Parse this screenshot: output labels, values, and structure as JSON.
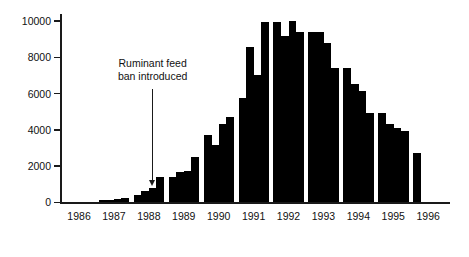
{
  "chart_data": {
    "type": "bar",
    "title": "",
    "subtitle": "",
    "xlabel": "",
    "ylabel": "",
    "ylim": [
      0,
      10400
    ],
    "yticks": [
      0,
      2000,
      4000,
      6000,
      8000,
      10000
    ],
    "ytick_labels": [
      "0",
      "2000",
      "4000",
      "6000",
      "8000",
      "10000"
    ],
    "xticks": [
      1986,
      1987,
      1988,
      1989,
      1990,
      1991,
      1992,
      1993,
      1994,
      1995,
      1996
    ],
    "xtick_labels": [
      "1986",
      "1987",
      "1988",
      "1989",
      "1990",
      "1991",
      "1992",
      "1993",
      "1994",
      "1995",
      "1996"
    ],
    "grid": false,
    "legend": "none",
    "bar_color": "#000000",
    "x_unit": "quarter",
    "categories": [
      "1986 Q1",
      "1986 Q2",
      "1986 Q3",
      "1986 Q4",
      "1987 Q1",
      "1987 Q2",
      "1987 Q3",
      "1987 Q4",
      "1988 Q1",
      "1988 Q2",
      "1988 Q3",
      "1988 Q4",
      "1989 Q1",
      "1989 Q2",
      "1989 Q3",
      "1989 Q4",
      "1990 Q1",
      "1990 Q2",
      "1990 Q3",
      "1990 Q4",
      "1991 Q1",
      "1991 Q2",
      "1991 Q3",
      "1991 Q4",
      "1992 Q1",
      "1992 Q2",
      "1992 Q3",
      "1992 Q4",
      "1993 Q1",
      "1993 Q2",
      "1993 Q3",
      "1993 Q4",
      "1994 Q1",
      "1994 Q2",
      "1994 Q3",
      "1994 Q4",
      "1995 Q1",
      "1995 Q2",
      "1995 Q3",
      "1995 Q4",
      "1996 Q1"
    ],
    "values": [
      0,
      0,
      0,
      0,
      120,
      130,
      190,
      260,
      420,
      620,
      790,
      1400,
      1400,
      1700,
      1720,
      2500,
      3700,
      3150,
      4350,
      4700,
      5750,
      8600,
      7050,
      9950,
      9950,
      9200,
      10000,
      9400,
      9400,
      9400,
      8800,
      7400,
      7400,
      6550,
      6150,
      4950,
      4950,
      4350,
      4100,
      3950,
      2750
    ]
  },
  "annotation": {
    "line1": "Ruminant feed",
    "line2": "ban introduced",
    "points_to": "1988 Q3"
  }
}
